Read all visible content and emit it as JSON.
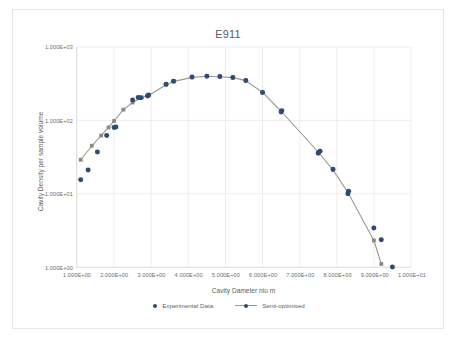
{
  "chart_data": {
    "type": "scatter",
    "title": "E911",
    "xlabel": "Cavity Dameter niu m",
    "ylabel": "Cavity Density per sample volume",
    "xscale": "linear",
    "yscale": "log",
    "xlim": [
      1,
      10
    ],
    "ylim": [
      1,
      1000
    ],
    "grid": true,
    "legend_position": "bottom",
    "xticks": [
      1,
      2,
      3,
      4,
      5,
      6,
      7,
      8,
      9,
      10
    ],
    "xticklabels": [
      "1.000E+00",
      "2.000E+00",
      "3.000E+00",
      "4.000E+00",
      "5.000E+00",
      "6.000E+00",
      "7.000E+00",
      "8.000E+00",
      "9.000E+00",
      "1.000E+01"
    ],
    "yticks": [
      1,
      10,
      100,
      1000
    ],
    "yticklabels": [
      "1.000E+00",
      "1.000E+01",
      "1.000E+02",
      "1.000E+03"
    ],
    "series": [
      {
        "name": "Experimental Data",
        "type": "scatter",
        "color": "#2e4a77",
        "marker": "circle",
        "points": [
          [
            1.1,
            15.5
          ],
          [
            1.3,
            21.0
          ],
          [
            1.55,
            37.0
          ],
          [
            1.8,
            62.0
          ],
          [
            2.0,
            80.0
          ],
          [
            2.05,
            81.0
          ],
          [
            2.5,
            190.0
          ],
          [
            2.65,
            205.0
          ],
          [
            2.72,
            203.0
          ],
          [
            2.9,
            215.0
          ],
          [
            2.93,
            222.0
          ],
          [
            3.4,
            310.0
          ],
          [
            3.6,
            340.0
          ],
          [
            4.1,
            390.0
          ],
          [
            4.5,
            400.0
          ],
          [
            4.85,
            395.0
          ],
          [
            5.2,
            385.0
          ],
          [
            5.55,
            350.0
          ],
          [
            6.0,
            240.0
          ],
          [
            6.5,
            130.0
          ],
          [
            6.52,
            135.0
          ],
          [
            7.5,
            35.5
          ],
          [
            7.55,
            38.0
          ],
          [
            7.9,
            21.5
          ],
          [
            8.3,
            10.0
          ],
          [
            8.32,
            10.8
          ],
          [
            9.0,
            3.4
          ],
          [
            9.2,
            2.35
          ],
          [
            9.5,
            1.0
          ]
        ]
      },
      {
        "name": "Semi-optimised",
        "type": "line",
        "color": "#9a9a8e",
        "marker_color": "#8a8a7e",
        "marker": "square",
        "points": [
          [
            1.1,
            29.0
          ],
          [
            1.4,
            45.0
          ],
          [
            1.65,
            62.0
          ],
          [
            1.85,
            80.0
          ],
          [
            2.0,
            98.0
          ],
          [
            2.25,
            140.0
          ],
          [
            2.5,
            175.0
          ],
          [
            2.75,
            205.0
          ],
          [
            2.93,
            218.0
          ],
          [
            3.4,
            305.0
          ],
          [
            3.62,
            340.0
          ],
          [
            4.1,
            385.0
          ],
          [
            4.5,
            400.0
          ],
          [
            4.85,
            393.0
          ],
          [
            5.2,
            382.0
          ],
          [
            5.55,
            348.0
          ],
          [
            6.0,
            240.0
          ],
          [
            6.5,
            133.0
          ],
          [
            7.5,
            37.0
          ],
          [
            7.9,
            21.0
          ],
          [
            8.3,
            10.4
          ],
          [
            9.0,
            2.3
          ],
          [
            9.2,
            1.1
          ]
        ]
      }
    ]
  },
  "legend": {
    "items": [
      {
        "label": "Experimental Data",
        "marker": "dot"
      },
      {
        "label": "Semi-optimised",
        "marker": "line-dot"
      }
    ]
  },
  "colors": {
    "experimental": "#2e4a77",
    "semi_optimised_line": "#9a9a8e",
    "semi_optimised_marker": "#8a8a7e",
    "grid": "#ededed",
    "axis": "#d9d9d9",
    "text": "#5f5f5f",
    "card_border": "#e6e6e6"
  }
}
